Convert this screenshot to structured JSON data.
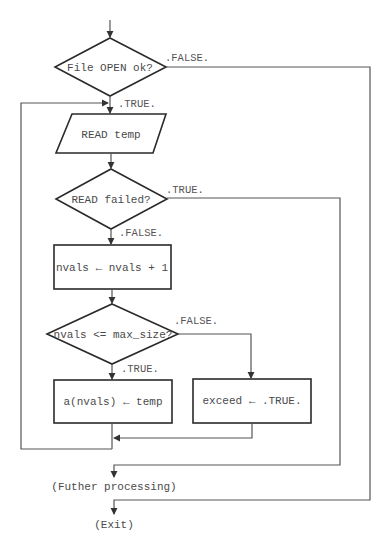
{
  "diagram": {
    "type": "flowchart",
    "nodes": {
      "file_open": {
        "shape": "decision",
        "text": "File OPEN ok?"
      },
      "read_temp": {
        "shape": "input-output",
        "text": "READ temp"
      },
      "read_failed": {
        "shape": "decision",
        "text": "READ failed?"
      },
      "increment": {
        "shape": "process",
        "text": "nvals ← nvals + 1"
      },
      "size_check": {
        "shape": "decision",
        "text": "nvals <= max_size?"
      },
      "store": {
        "shape": "process",
        "text": "a(nvals) ← temp"
      },
      "exceed": {
        "shape": "process",
        "text": "exceed ← .TRUE."
      },
      "further": {
        "shape": "terminal-text",
        "text": "(Futher processing)"
      },
      "exit": {
        "shape": "terminal-text",
        "text": "(Exit)"
      }
    },
    "edge_labels": {
      "file_open_false": ".FALSE.",
      "file_open_true": ".TRUE.",
      "read_failed_true": ".TRUE.",
      "read_failed_false": ".FALSE.",
      "size_check_false": ".FALSE.",
      "size_check_true": ".TRUE."
    },
    "edges": [
      {
        "from": "start",
        "to": "file_open"
      },
      {
        "from": "file_open",
        "to": "read_temp",
        "label": ".TRUE."
      },
      {
        "from": "file_open",
        "to": "exit",
        "label": ".FALSE."
      },
      {
        "from": "read_temp",
        "to": "read_failed"
      },
      {
        "from": "read_failed",
        "to": "increment",
        "label": ".FALSE."
      },
      {
        "from": "read_failed",
        "to": "further",
        "label": ".TRUE."
      },
      {
        "from": "increment",
        "to": "size_check"
      },
      {
        "from": "size_check",
        "to": "store",
        "label": ".TRUE."
      },
      {
        "from": "size_check",
        "to": "exceed",
        "label": ".FALSE."
      },
      {
        "from": "store",
        "to": "read_temp"
      },
      {
        "from": "exceed",
        "to": "read_temp"
      }
    ],
    "colors": {
      "line": "#555555",
      "box_border": "#2a2a2a",
      "text": "#4a4a4a",
      "background": "#ffffff"
    }
  }
}
